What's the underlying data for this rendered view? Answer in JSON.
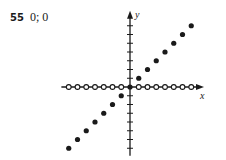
{
  "problem": {
    "number": "55",
    "answer": "0; 0"
  },
  "chart_data": {
    "type": "scatter",
    "title": "",
    "xlabel": "x",
    "ylabel": "y",
    "xlim": [
      -7.5,
      8
    ],
    "ylim": [
      -7.5,
      8.5
    ],
    "grid": false,
    "legend": "none",
    "tick_spacing": 1,
    "series": [
      {
        "name": "filled points (y = x, x ≠ 0)",
        "marker": "filled-circle",
        "x": [
          -7,
          -6,
          -5,
          -4,
          -3,
          -2,
          -1,
          1,
          2,
          3,
          4,
          5,
          6,
          7
        ],
        "y": [
          -7,
          -6,
          -5,
          -4,
          -3,
          -2,
          -1,
          1,
          2,
          3,
          4,
          5,
          6,
          7
        ]
      },
      {
        "name": "open points on x-axis",
        "marker": "open-circle",
        "x": [
          -7,
          -6,
          -5,
          -4,
          -3,
          -2,
          -1,
          1,
          2,
          3,
          4,
          5,
          6,
          7
        ],
        "y": [
          0,
          0,
          0,
          0,
          0,
          0,
          0,
          0,
          0,
          0,
          0,
          0,
          0,
          0
        ]
      },
      {
        "name": "origin",
        "marker": "filled-circle",
        "x": [
          0
        ],
        "y": [
          0
        ]
      }
    ]
  }
}
